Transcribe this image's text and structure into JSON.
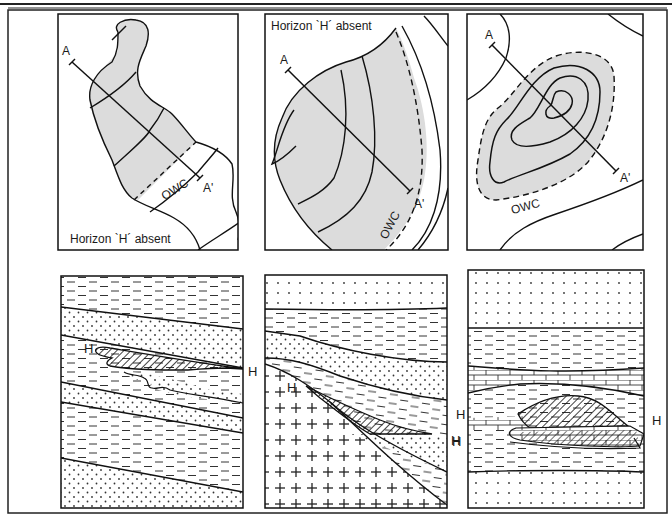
{
  "figure": {
    "type": "geological diagram",
    "colors": {
      "ink": "#1a1a1a",
      "reservoir_fill": "#dcdcdc",
      "background": "#ffffff"
    }
  },
  "maps": [
    {
      "id": "map-1",
      "section_start": "A",
      "section_end": "A'",
      "contact_label": "OWC",
      "note": "Horizon `H´ absent",
      "note_position": "bottom-left"
    },
    {
      "id": "map-2",
      "section_start": "A",
      "section_end": "A'",
      "contact_label": "OWC",
      "note": "Horizon `H´ absent",
      "note_position": "top-left"
    },
    {
      "id": "map-3",
      "section_start": "A",
      "section_end": "A'",
      "contact_label": "OWC"
    }
  ],
  "sections": [
    {
      "id": "section-1",
      "horizon_left": "H",
      "horizon_right": "H",
      "lithologies": [
        "shale",
        "sandstone",
        "shale",
        "sandstone",
        "shale",
        "sandstone"
      ],
      "trap": "pinch-out sand lens (hatched)"
    },
    {
      "id": "section-2",
      "horizon_left": "H",
      "horizon_right": "H",
      "lithologies": [
        "sandstone",
        "shale",
        "sandstone",
        "shale",
        "basement (crosses)"
      ],
      "trap": "onlap wedge against basement (hatched)"
    },
    {
      "id": "section-3",
      "horizon_left_upper": "H",
      "horizon_left_lower": "H",
      "horizon_right": "H",
      "lithologies": [
        "sandstone",
        "shale",
        "limestone",
        "shale",
        "reef/lens",
        "shale",
        "sandstone"
      ],
      "trap": "lenticular body within limestone (hatched)"
    }
  ]
}
